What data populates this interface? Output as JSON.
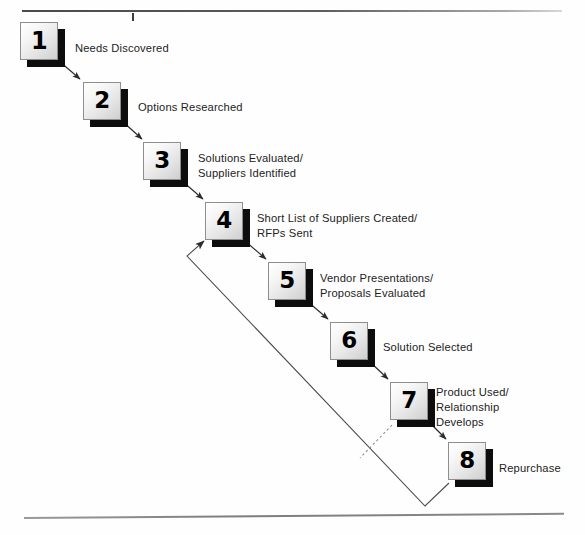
{
  "diagram": {
    "type": "staircase-flow",
    "rules": {
      "top": "horizontal-rule-top",
      "top_tick": "tick-mark",
      "bottom": "horizontal-rule-bottom"
    },
    "steps": [
      {
        "number": "1",
        "label": "Needs Discovered",
        "box_x": 20,
        "box_y": 22,
        "label_x": 75,
        "label_y": 41
      },
      {
        "number": "2",
        "label": "Options Researched",
        "box_x": 83,
        "box_y": 82,
        "label_x": 138,
        "label_y": 100
      },
      {
        "number": "3",
        "label": "Solutions Evaluated/\nSuppliers Identified",
        "box_x": 143,
        "box_y": 142,
        "label_x": 198,
        "label_y": 150
      },
      {
        "number": "4",
        "label": "Short List of Suppliers Created/\nRFPs Sent",
        "box_x": 205,
        "box_y": 202,
        "label_x": 257,
        "label_y": 211
      },
      {
        "number": "5",
        "label": "Vendor Presentations/\nProposals Evaluated",
        "box_x": 268,
        "box_y": 262,
        "label_x": 320,
        "label_y": 271
      },
      {
        "number": "6",
        "label": "Solution Selected",
        "box_x": 330,
        "box_y": 322,
        "label_x": 383,
        "label_y": 340
      },
      {
        "number": "7",
        "label": "Product Used/\nRelationship\nDevelops",
        "box_x": 390,
        "box_y": 382,
        "label_x": 436,
        "label_y": 385
      },
      {
        "number": "8",
        "label": "Repurchase",
        "box_x": 448,
        "box_y": 442,
        "label_x": 499,
        "label_y": 461
      }
    ],
    "connectors": [
      {
        "name": "arrow-1-to-2",
        "from": "1",
        "to": "2",
        "style": "solid-arrow"
      },
      {
        "name": "arrow-2-to-3",
        "from": "2",
        "to": "3",
        "style": "solid-arrow"
      },
      {
        "name": "arrow-3-to-4",
        "from": "3",
        "to": "4",
        "style": "solid-arrow"
      },
      {
        "name": "arrow-4-to-5",
        "from": "4",
        "to": "5",
        "style": "solid-arrow"
      },
      {
        "name": "arrow-5-to-6",
        "from": "5",
        "to": "6",
        "style": "solid-arrow"
      },
      {
        "name": "arrow-6-to-7",
        "from": "6",
        "to": "7",
        "style": "solid-arrow"
      },
      {
        "name": "arrow-7-to-8",
        "from": "7",
        "to": "8",
        "style": "solid-arrow"
      },
      {
        "name": "feedback-loop-8-to-4",
        "from": "8",
        "to": "4",
        "style": "solid-polyline-arrow"
      },
      {
        "name": "dashed-link-7-to-feedback",
        "from": "7",
        "to": "feedback-loop",
        "style": "dashed"
      }
    ],
    "colors": {
      "box_border": "#8e8e8e",
      "box_shadow": "#0d0d0d",
      "text": "#232323",
      "connector": "#3a3a3a",
      "rule": "#6a6a6a"
    }
  }
}
